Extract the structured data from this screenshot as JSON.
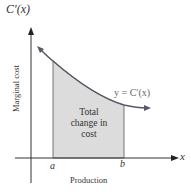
{
  "diagram": {
    "y_axis_label": "C′(x)",
    "x_axis_label": "x",
    "y_axis_title": "Marginal cost",
    "x_axis_title": "Production",
    "curve_label": "y = C′(x)",
    "lower_bound_label": "a",
    "upper_bound_label": "b",
    "region_label": "Total change in cost",
    "colors": {
      "curve": "#555a66",
      "region_fill": "#dcdcdc",
      "axes": "#333333"
    }
  }
}
